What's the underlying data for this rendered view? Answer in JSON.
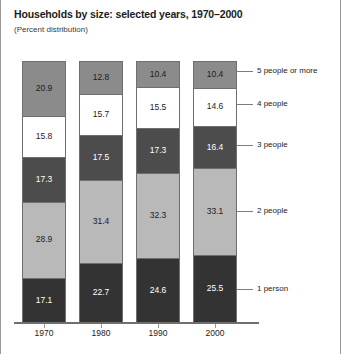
{
  "chart_data": {
    "type": "bar",
    "title": "Households by size: selected years, 1970–2000",
    "subtitle": "(Percent distribution)",
    "xlabel": "",
    "ylabel": "",
    "ylim": [
      0,
      100
    ],
    "grid": false,
    "stacked": true,
    "legend_position": "right-callout",
    "categories": [
      "1970",
      "1980",
      "1990",
      "2000"
    ],
    "series": [
      {
        "name": "1 person",
        "values": [
          17.1,
          22.7,
          24.6,
          25.5
        ],
        "color": "#333333",
        "text_color": "#ffffff"
      },
      {
        "name": "2 people",
        "values": [
          28.9,
          31.4,
          32.3,
          33.1
        ],
        "color": "#b9b9b9",
        "text_color": "#1c1c1c"
      },
      {
        "name": "3 people",
        "values": [
          17.3,
          17.5,
          17.3,
          16.4
        ],
        "color": "#4c4c4c",
        "text_color": "#ffffff"
      },
      {
        "name": "4 people",
        "values": [
          15.8,
          15.7,
          15.5,
          14.6
        ],
        "color": "#ffffff",
        "text_color": "#1c1c1c"
      },
      {
        "name": "5 people or more",
        "values": [
          20.9,
          12.8,
          10.4,
          10.4
        ],
        "color": "#8b8b8b",
        "text_color": "#1c1c1c"
      }
    ]
  },
  "legend": {
    "items": [
      {
        "label": "5 people or more"
      },
      {
        "label": "4 people"
      },
      {
        "label": "3 people"
      },
      {
        "label": "2 people"
      },
      {
        "label": "1 person"
      }
    ]
  }
}
